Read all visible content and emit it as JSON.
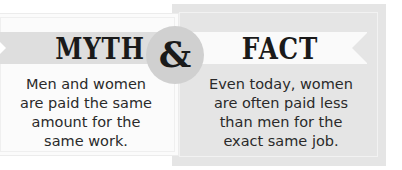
{
  "myth": {
    "title": "MYTH",
    "lines": [
      "Men and women",
      "are paid the same",
      "amount for the",
      "same work."
    ]
  },
  "connector": {
    "symbol": "&"
  },
  "fact": {
    "title": "FACT",
    "lines": [
      "Even today, women",
      "are often paid less",
      "than men for the",
      "exact same job."
    ]
  },
  "colors": {
    "myth_panel": "#fbfbfb",
    "myth_ribbon": "#dedede",
    "fact_panel": "#e5e5e5",
    "fact_ribbon": "#fafafa",
    "circle": "#d0d0d0",
    "text": "#1a1a1a"
  }
}
